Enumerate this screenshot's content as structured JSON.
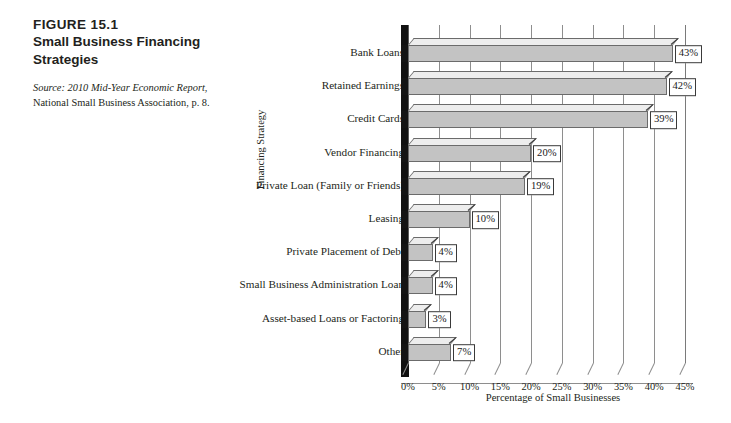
{
  "caption": {
    "figure_number": "FIGURE 15.1",
    "figure_title_line1": "Small Business Financing",
    "figure_title_line2": "Strategies",
    "source_label": "Source:",
    "source_italic_text": " 2010 Mid-Year Economic Report",
    "source_rest_text": ", National Small Business Association, p. 8."
  },
  "chart_data": {
    "type": "bar",
    "orientation": "horizontal",
    "title": "Small Business Financing Strategies",
    "xlabel": "Percentage of Small Businesses",
    "ylabel": "Financing Strategy",
    "categories": [
      "Bank Loans",
      "Retained Earnings",
      "Credit Cards",
      "Vendor Financing",
      "Private Loan (Family or Friends)",
      "Leasing",
      "Private Placement of Debt",
      "Small Business Administration Loan",
      "Asset-based Loans or Factoring",
      "Other"
    ],
    "values": [
      43,
      42,
      39,
      20,
      19,
      10,
      4,
      4,
      3,
      7
    ],
    "data_labels": [
      "43%",
      "42%",
      "39%",
      "20%",
      "19%",
      "10%",
      "4%",
      "4%",
      "3%",
      "7%"
    ],
    "xlim": [
      0,
      45
    ],
    "xtick_values": [
      0,
      5,
      10,
      15,
      20,
      25,
      30,
      35,
      40,
      45
    ],
    "xtick_labels": [
      "0%",
      "5%",
      "10%",
      "15%",
      "20%",
      "25%",
      "30%",
      "35%",
      "40%",
      "45%"
    ],
    "grid": true,
    "grid_axis": "x",
    "legend": false,
    "style_3d": true,
    "bar_fill_color": "#c3c3c3",
    "bar_top_color": "#ededed",
    "bar_edge_color": "#6b6b6b",
    "grid_color": "#8e8e8e",
    "background_color": "#ffffff",
    "text_color": "#231f20"
  }
}
